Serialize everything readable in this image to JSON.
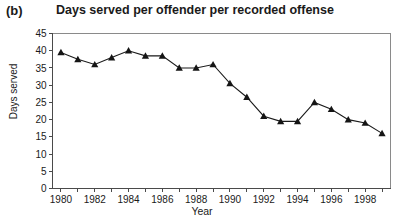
{
  "panel": {
    "label": "(b)"
  },
  "chart_data": {
    "type": "line",
    "title": "Days served per offender per recorded offense",
    "xlabel": "Year",
    "ylabel": "Days served",
    "x": [
      1980,
      1981,
      1982,
      1983,
      1984,
      1985,
      1986,
      1987,
      1988,
      1989,
      1990,
      1991,
      1992,
      1993,
      1994,
      1995,
      1996,
      1997,
      1998,
      1999
    ],
    "values": [
      39.5,
      37.5,
      36,
      38,
      40,
      38.5,
      38.5,
      35,
      35,
      36,
      30.5,
      26.5,
      21,
      19.5,
      19.5,
      25,
      23,
      20,
      19,
      16
    ],
    "series": [
      {
        "name": "Days served per offender per recorded offense",
        "values": [
          39.5,
          37.5,
          36,
          38,
          40,
          38.5,
          38.5,
          35,
          35,
          36,
          30.5,
          26.5,
          21,
          19.5,
          19.5,
          25,
          23,
          20,
          19,
          16
        ]
      }
    ],
    "ylim": [
      0,
      45
    ],
    "xlim": [
      1979.5,
      1999.5
    ],
    "yticks": [
      0,
      5,
      10,
      15,
      20,
      25,
      30,
      35,
      40,
      45
    ],
    "ytick_labels": [
      "0",
      "5",
      "10",
      "15",
      "20",
      "25",
      "30",
      "35",
      "40",
      "45"
    ],
    "xticks": [
      1980,
      1981,
      1982,
      1983,
      1984,
      1985,
      1986,
      1987,
      1988,
      1989,
      1990,
      1991,
      1992,
      1993,
      1994,
      1995,
      1996,
      1997,
      1998,
      1999
    ],
    "xtick_labels": [
      "1980",
      "",
      "1982",
      "",
      "1984",
      "",
      "1986",
      "",
      "1988",
      "",
      "1990",
      "",
      "1992",
      "",
      "1994",
      "",
      "1996",
      "",
      "1998",
      ""
    ],
    "grid": false,
    "legend": false,
    "marker": "triangle",
    "line_color": "#1a1a1a",
    "marker_color": "#151515"
  }
}
